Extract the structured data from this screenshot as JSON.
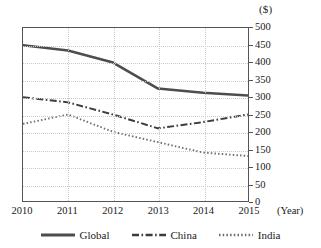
{
  "chart_data": {
    "type": "line",
    "title": "",
    "xlabel": "(Year)",
    "ylabel": "($)",
    "unit_label": "($)",
    "x": [
      "2010",
      "2011",
      "2012",
      "2013",
      "2014",
      "2015"
    ],
    "categories": [
      "2010",
      "2011",
      "2012",
      "2013",
      "2014",
      "2015"
    ],
    "xlim": [
      2010,
      2015
    ],
    "ylim": [
      0,
      500
    ],
    "ytick_values": [
      0,
      50,
      100,
      150,
      200,
      250,
      300,
      350,
      400,
      450,
      500
    ],
    "ytick_labels": [
      "0",
      "50",
      "100",
      "150",
      "200",
      "250",
      "300",
      "350",
      "400",
      "450",
      "500"
    ],
    "grid": true,
    "legend_position": "bottom",
    "series": [
      {
        "name": "Global",
        "style": "solid",
        "color": "#4d4d4d",
        "values": [
          450,
          435,
          400,
          325,
          313,
          305
        ]
      },
      {
        "name": "China",
        "style": "dash-dot",
        "color": "#3c3c3c",
        "values": [
          300,
          285,
          250,
          210,
          228,
          250
        ]
      },
      {
        "name": "India",
        "style": "dotted",
        "color": "#6b6b6b",
        "values": [
          223,
          250,
          200,
          170,
          140,
          130
        ]
      }
    ]
  },
  "legend": {
    "items": [
      {
        "label": "Global"
      },
      {
        "label": "China"
      },
      {
        "label": "India"
      }
    ]
  }
}
